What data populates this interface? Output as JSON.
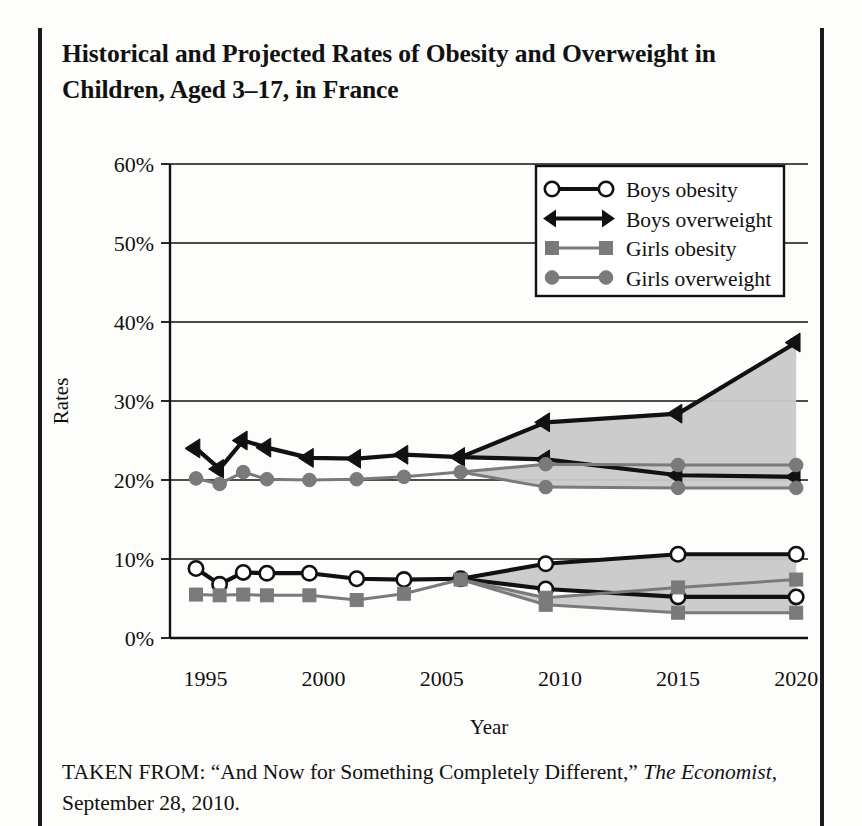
{
  "figure": {
    "title": "Historical and Projected Rates of Obesity and Overweight in Children, Aged 3–17, in France",
    "caption_prefix": "TAKEN FROM: “And Now for Something Completely Different,” ",
    "caption_italic": "The Economist",
    "caption_suffix": ", September 28, 2010."
  },
  "chart_data": {
    "type": "line",
    "title": "Historical and Projected Rates of Obesity and Overweight in Children, Aged 3–17, in France",
    "xlabel": "Year",
    "ylabel": "Rates",
    "xlim": [
      1993.5,
      2020.5
    ],
    "ylim": [
      0,
      60
    ],
    "ytick_values": [
      0,
      10,
      20,
      30,
      40,
      50,
      60
    ],
    "ytick_labels": [
      "0%",
      "10%",
      "20%",
      "30%",
      "40%",
      "50%",
      "60%"
    ],
    "xtick_values": [
      1995,
      2000,
      2005,
      2010,
      2015,
      2020
    ],
    "xtick_labels": [
      "1995",
      "2000",
      "2005",
      "2010",
      "2015",
      "2020"
    ],
    "grid": "horizontal",
    "legend_position": "top-right",
    "units": "percent",
    "projection_note": "Solid historical data through 2006; fanned projection bands (gray shaded) from 2006 to 2020.",
    "series": [
      {
        "name": "Boys obesity",
        "marker": "open-circle",
        "color": "#111111",
        "historical": {
          "x": [
            1994.6,
            1995.6,
            1996.6,
            1997.6,
            1999.4,
            2001.4,
            2003.4,
            2005.8
          ],
          "y": [
            8.8,
            6.8,
            8.3,
            8.2,
            8.2,
            7.5,
            7.4,
            7.5
          ]
        },
        "projection_high": {
          "x": [
            2005.8,
            2009.4,
            2015.0,
            2020.0
          ],
          "y": [
            7.5,
            9.4,
            10.6,
            10.6
          ]
        },
        "projection_low": {
          "x": [
            2005.8,
            2009.4,
            2015.0,
            2020.0
          ],
          "y": [
            7.5,
            6.2,
            5.2,
            5.2
          ]
        }
      },
      {
        "name": "Boys overweight",
        "marker": "filled-triangle",
        "color": "#111111",
        "historical": {
          "x": [
            1994.6,
            1995.6,
            1996.6,
            1997.6,
            1999.4,
            2001.4,
            2003.4,
            2005.8
          ],
          "y": [
            24.0,
            21.4,
            25.0,
            24.1,
            22.8,
            22.7,
            23.2,
            22.9
          ]
        },
        "projection_high": {
          "x": [
            2005.8,
            2009.4,
            2015.0,
            2020.0
          ],
          "y": [
            22.9,
            27.3,
            28.4,
            37.4
          ]
        },
        "projection_low": {
          "x": [
            2005.8,
            2009.4,
            2015.0,
            2020.0
          ],
          "y": [
            22.9,
            22.6,
            20.6,
            20.4
          ]
        }
      },
      {
        "name": "Girls obesity",
        "marker": "filled-square",
        "color": "#7a7a7a",
        "historical": {
          "x": [
            1994.6,
            1995.6,
            1996.6,
            1997.6,
            1999.4,
            2001.4,
            2003.4,
            2005.8
          ],
          "y": [
            5.5,
            5.4,
            5.5,
            5.4,
            5.4,
            4.8,
            5.6,
            7.4
          ]
        },
        "projection_high": {
          "x": [
            2005.8,
            2009.4,
            2015.0,
            2020.0
          ],
          "y": [
            7.4,
            5.1,
            6.4,
            7.4
          ]
        },
        "projection_low": {
          "x": [
            2005.8,
            2009.4,
            2015.0,
            2020.0
          ],
          "y": [
            7.4,
            4.2,
            3.2,
            3.2
          ]
        }
      },
      {
        "name": "Girls overweight",
        "marker": "filled-circle",
        "color": "#7a7a7a",
        "historical": {
          "x": [
            1994.6,
            1995.6,
            1996.6,
            1997.6,
            1999.4,
            2001.4,
            2003.4,
            2005.8
          ],
          "y": [
            20.2,
            19.5,
            21.0,
            20.1,
            20.0,
            20.1,
            20.4,
            21.0
          ]
        },
        "projection_high": {
          "x": [
            2005.8,
            2009.4,
            2015.0,
            2020.0
          ],
          "y": [
            21.0,
            22.0,
            21.9,
            21.9
          ]
        },
        "projection_low": {
          "x": [
            2005.8,
            2009.4,
            2015.0,
            2020.0
          ],
          "y": [
            21.0,
            19.1,
            19.0,
            19.0
          ]
        }
      }
    ]
  },
  "legend": {
    "entries": [
      {
        "label": "Boys obesity"
      },
      {
        "label": "Boys overweight"
      },
      {
        "label": "Girls obesity"
      },
      {
        "label": "Girls overweight"
      }
    ]
  },
  "colors": {
    "ink": "#111111",
    "gray_series": "#7a7a7a",
    "band_fill": "#c9c9c9",
    "frame": "#1b1b1b"
  }
}
